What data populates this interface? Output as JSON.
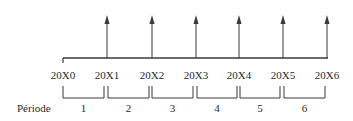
{
  "diagram": {
    "type": "timeline",
    "line_color": "#3a3a3a",
    "years": [
      {
        "label": "20X0",
        "x": 63,
        "arrow": false
      },
      {
        "label": "20X1",
        "x": 107,
        "arrow": true
      },
      {
        "label": "20X2",
        "x": 152,
        "arrow": true
      },
      {
        "label": "20X3",
        "x": 196,
        "arrow": true
      },
      {
        "label": "20X4",
        "x": 239,
        "arrow": true
      },
      {
        "label": "20X5",
        "x": 283,
        "arrow": true
      },
      {
        "label": "20X6",
        "x": 327,
        "arrow": true
      }
    ],
    "period_title": "Période",
    "periods": [
      {
        "label": "1",
        "x1": 63,
        "x2": 104
      },
      {
        "label": "2",
        "x1": 108,
        "x2": 149
      },
      {
        "label": "3",
        "x1": 152,
        "x2": 193
      },
      {
        "label": "4",
        "x1": 197,
        "x2": 237
      },
      {
        "label": "5",
        "x1": 240,
        "x2": 280
      },
      {
        "label": "6",
        "x1": 284,
        "x2": 325
      }
    ]
  }
}
